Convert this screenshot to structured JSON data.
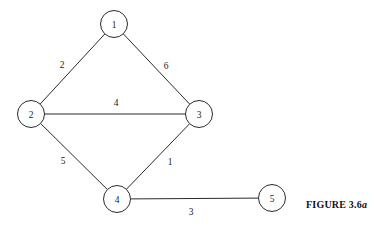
{
  "figure": {
    "caption_main": "FIGURE 3.6",
    "caption_suffix": "a"
  },
  "chart_data": {
    "type": "diagram",
    "diagram_kind": "weighted-undirected-graph",
    "title": "FIGURE 3.6a",
    "nodes": [
      {
        "id": "1",
        "label": "1",
        "x": 114,
        "y": 24,
        "r": 13.5
      },
      {
        "id": "2",
        "label": "2",
        "x": 31,
        "y": 114,
        "r": 13.5
      },
      {
        "id": "3",
        "label": "3",
        "x": 199,
        "y": 114,
        "r": 13.5
      },
      {
        "id": "4",
        "label": "4",
        "x": 117,
        "y": 199,
        "r": 13.5
      },
      {
        "id": "5",
        "label": "5",
        "x": 272,
        "y": 198,
        "r": 13.5
      }
    ],
    "edges": [
      {
        "source": "1",
        "target": "2",
        "weight": "2",
        "label_x": 62,
        "label_y": 65
      },
      {
        "source": "1",
        "target": "3",
        "weight": "6",
        "label_x": 166,
        "label_y": 66
      },
      {
        "source": "2",
        "target": "3",
        "weight": "4",
        "label_x": 116,
        "label_y": 103
      },
      {
        "source": "2",
        "target": "4",
        "weight": "5",
        "label_x": 63,
        "label_y": 161
      },
      {
        "source": "3",
        "target": "4",
        "weight": "1",
        "label_x": 170,
        "label_y": 162
      },
      {
        "source": "4",
        "target": "5",
        "weight": "3",
        "label_x": 191,
        "label_y": 212
      }
    ],
    "colors": {
      "background": "#ffffff",
      "stroke": "#2b2b2b",
      "text": "#1a1a1a"
    }
  }
}
